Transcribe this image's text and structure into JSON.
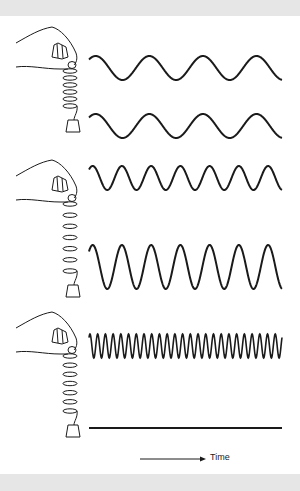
{
  "figure": {
    "time_label": "Time",
    "colors": {
      "ink": "#1a1a1a",
      "band": "#e6e6e6",
      "background": "#ffffff"
    },
    "panels": [
      {
        "name": "spring-stiff-weight-small",
        "coils": 6,
        "waves": [
          {
            "label": "position",
            "center_y": 68,
            "amplitude": 12,
            "cycles": 3.6
          },
          {
            "label": "velocity",
            "center_y": 126,
            "amplitude": 12,
            "cycles": 3.6
          }
        ]
      },
      {
        "name": "spring-medium",
        "coils": 7,
        "waves": [
          {
            "label": "higher-frequency",
            "center_y": 178,
            "amplitude": 12,
            "cycles": 6.6
          },
          {
            "label": "higher-frequency-larger-amplitude",
            "center_y": 267,
            "amplitude": 22,
            "cycles": 6.6
          }
        ]
      },
      {
        "name": "spring-stiffest",
        "coils": 7,
        "waves": [
          {
            "label": "very-high-frequency",
            "center_y": 346,
            "amplitude": 12,
            "cycles": 25
          },
          {
            "label": "flat-line",
            "center_y": 428,
            "amplitude": 0,
            "cycles": 0
          }
        ]
      }
    ]
  }
}
